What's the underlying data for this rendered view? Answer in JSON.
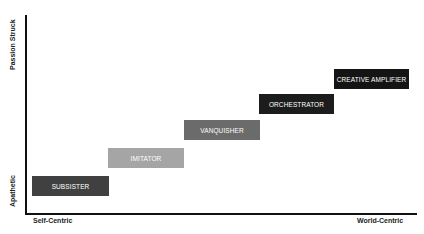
{
  "axes": {
    "y_top_label": "Passion Struck",
    "y_bottom_label": "Apathetic",
    "x_left_label": "Self-Centric",
    "x_right_label": "World-Centric"
  },
  "stages": [
    {
      "label": "SUBSISTER",
      "color": "#404040"
    },
    {
      "label": "IMITATOR",
      "color": "#a5a5a5"
    },
    {
      "label": "VANQUISHER",
      "color": "#6b6b6b"
    },
    {
      "label": "ORCHESTRATOR",
      "color": "#1c1c1c"
    },
    {
      "label": "CREATIVE AMPLIFIER",
      "color": "#141414"
    }
  ]
}
